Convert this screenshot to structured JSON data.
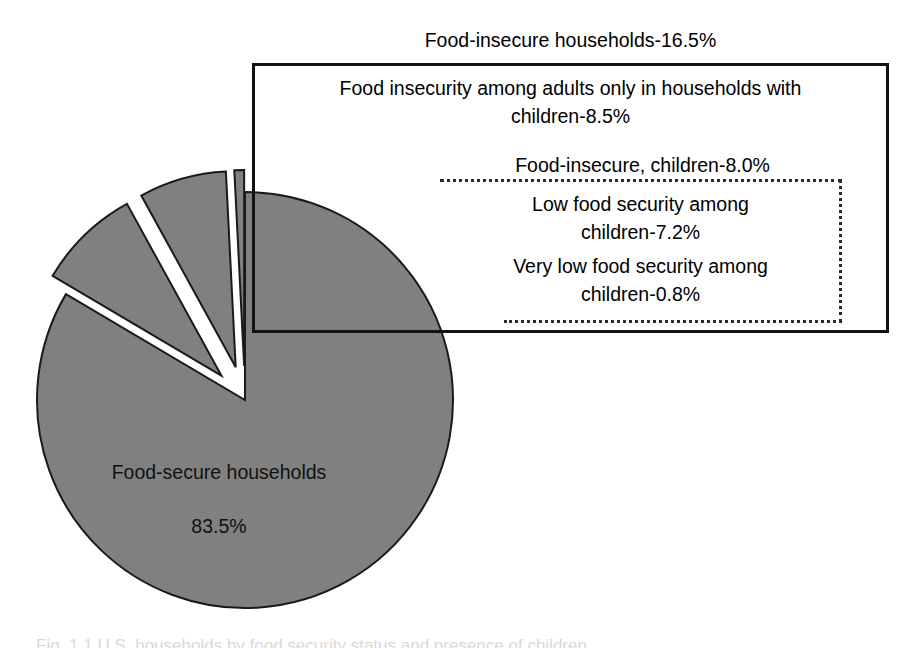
{
  "figure": {
    "type": "exploded-pie-chart",
    "background_color": "#ffffff",
    "slice_fill_color": "#808080",
    "slice_stroke_color": "#1a1a1a"
  },
  "callout": {
    "title": "Food-insecure households-16.5%",
    "adults_line1": "Food insecurity among adults only in households with",
    "adults_line2": "children-8.5%",
    "children_heading": "Food-insecure, children-8.0%",
    "low_line1": "Low food security among",
    "low_line2": "children-7.2%",
    "verylow_line1": "Very low food security among",
    "verylow_line2": "children-0.8%"
  },
  "pie_label": {
    "line1": "Food-secure households",
    "line2": "83.5%"
  },
  "caption": {
    "text": "Fig. 1.1  U.S. households by food security status and presence of children"
  },
  "chart_data": {
    "type": "pie",
    "title": "Food-insecure households-16.5%",
    "categories": [
      "Food-secure households",
      "Food insecurity among adults only in households with children",
      "Low food security among children",
      "Very low food security among children"
    ],
    "values": [
      83.5,
      8.5,
      7.2,
      0.8
    ],
    "unit": "%",
    "total": 100.0,
    "exploded": [
      false,
      true,
      true,
      true
    ],
    "groups": [
      {
        "name": "Food-insecure households",
        "value": 16.5,
        "members": [
          "Food insecurity among adults only in households with children-8.5%",
          "Food-insecure, children-8.0%"
        ]
      },
      {
        "name": "Food-insecure, children",
        "value": 8.0,
        "members": [
          "Low food security among children-7.2%",
          "Very low food security among children-0.8%"
        ]
      }
    ],
    "data_labels": [
      "Food-secure households 83.5%",
      "Food insecurity among adults only in households with children-8.5%",
      "Low food security among children-7.2%",
      "Very low food security among children-0.8%"
    ],
    "legend": "none",
    "grid": false
  }
}
